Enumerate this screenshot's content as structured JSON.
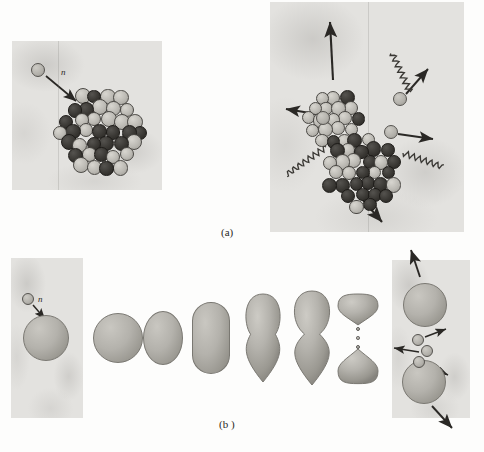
{
  "figure": {
    "background_color": "#fdfdfc",
    "panel_color": "#e3e2df",
    "ink_color": "#2a2825"
  },
  "captions": {
    "a": "(a)",
    "b": "(b )"
  },
  "labels": {
    "neutron_a": "n",
    "neutron_b": "n"
  },
  "panel_a": {
    "name": "nucleon-model-panel",
    "left": {
      "name": "before-fission-box",
      "description": "incident neutron approaching a heavy nucleus of packed nucleons",
      "incident_neutron": {
        "cx": 38,
        "cy": 70,
        "r": 7
      },
      "label_pos": {
        "x": 61,
        "y": 68
      },
      "arrow": {
        "x1": 46,
        "y1": 76,
        "x2": 76,
        "y2": 101
      },
      "nucleus": {
        "cx": 101,
        "cy": 132,
        "r": 47,
        "nucleon_r": 7.5,
        "nucleon_count": 78
      }
    },
    "right": {
      "name": "after-fission-box",
      "description": "two fission fragments recoiling, three free neutrons and gamma rays emitted",
      "fragments": [
        {
          "name": "upper-fragment",
          "cx": 333,
          "cy": 119,
          "r": 29,
          "nucleon_r": 7,
          "nucleon_count": 30
        },
        {
          "name": "lower-fragment",
          "cx": 362,
          "cy": 173,
          "r": 38,
          "nucleon_r": 7.2,
          "nucleon_count": 48
        }
      ],
      "neutrons": [
        {
          "name": "neutron-left",
          "cx": 323,
          "cy": 118,
          "r": 7
        },
        {
          "name": "neutron-upper-right",
          "cx": 400,
          "cy": 99,
          "r": 7
        },
        {
          "name": "neutron-right",
          "cx": 391,
          "cy": 132,
          "r": 7
        }
      ],
      "fragment_arrows": [
        {
          "name": "upper-fragment-arrow",
          "x1": 333,
          "y1": 80,
          "x2": 330,
          "y2": 22
        },
        {
          "name": "lower-fragment-arrow",
          "x1": 362,
          "y1": 199,
          "x2": 382,
          "y2": 222
        }
      ],
      "neutron_arrows": [
        {
          "name": "neutron-left-arrow",
          "x1": 316,
          "y1": 114,
          "x2": 286,
          "y2": 109
        },
        {
          "name": "neutron-upper-right-arrow",
          "x1": 406,
          "y1": 94,
          "x2": 428,
          "y2": 69
        },
        {
          "name": "neutron-right-arrow",
          "x1": 398,
          "y1": 134,
          "x2": 433,
          "y2": 139
        }
      ],
      "gamma_rays": [
        {
          "name": "gamma-ray-upper",
          "x1": 410,
          "y1": 92,
          "x2": 392,
          "y2": 53
        },
        {
          "name": "gamma-ray-lower-left",
          "x1": 326,
          "y1": 147,
          "x2": 286,
          "y2": 175
        },
        {
          "name": "gamma-ray-lower-right",
          "x1": 403,
          "y1": 153,
          "x2": 443,
          "y2": 167
        }
      ]
    }
  },
  "panel_b": {
    "name": "liquid-drop-model-panel",
    "left": {
      "name": "drop-before-fission-box",
      "incident_neutron": {
        "cx": 28,
        "cy": 299,
        "r": 6
      },
      "label_pos": {
        "x": 38,
        "y": 295
      },
      "arrow": {
        "x1": 33,
        "y1": 305,
        "x2": 45,
        "y2": 319
      },
      "drop": {
        "cx": 46,
        "cy": 338,
        "rx": 23,
        "ry": 23
      }
    },
    "sequence": [
      {
        "name": "stage-sphere",
        "shape": "sphere",
        "cx": 118,
        "cy": 338,
        "rx": 25,
        "ry": 25
      },
      {
        "name": "stage-ellipse",
        "shape": "ellipse",
        "cx": 163,
        "cy": 338,
        "rx": 20,
        "ry": 27
      },
      {
        "name": "stage-elongated",
        "shape": "capsule",
        "cx": 211,
        "cy": 338,
        "rx": 19,
        "ry": 36
      },
      {
        "name": "stage-waisted",
        "shape": "dumbbell",
        "cx": 263,
        "cy": 338,
        "rx": 20,
        "ry": 45,
        "neck": 0.62
      },
      {
        "name": "stage-necked",
        "shape": "dumbbell",
        "cx": 312,
        "cy": 338,
        "rx": 22,
        "ry": 48,
        "neck": 0.34
      },
      {
        "name": "stage-scission",
        "shape": "split-pair",
        "cx": 358,
        "cy": 338,
        "rx": 20,
        "ry": 46
      }
    ],
    "right": {
      "name": "drop-fragments-box",
      "fragments": [
        {
          "name": "upper-drop-fragment",
          "cx": 425,
          "cy": 305,
          "r": 22
        },
        {
          "name": "lower-drop-fragment",
          "cx": 424,
          "cy": 382,
          "r": 22
        }
      ],
      "neutrons": [
        {
          "name": "drop-neutron-top",
          "cx": 418,
          "cy": 340,
          "r": 6
        },
        {
          "name": "drop-neutron-middle",
          "cx": 427,
          "cy": 351,
          "r": 6
        },
        {
          "name": "drop-neutron-bottom",
          "cx": 419,
          "cy": 362,
          "r": 6
        }
      ],
      "arrows": [
        {
          "name": "upper-fragment-arrow",
          "x1": 420,
          "y1": 277,
          "x2": 411,
          "y2": 250
        },
        {
          "name": "neutron-top-arrow",
          "x1": 425,
          "y1": 337,
          "x2": 446,
          "y2": 329
        },
        {
          "name": "neutron-middle-arrow",
          "x1": 419,
          "y1": 352,
          "x2": 394,
          "y2": 348
        },
        {
          "name": "neutron-bottom-arrow",
          "x1": 426,
          "y1": 365,
          "x2": 448,
          "y2": 375
        },
        {
          "name": "lower-fragment-arrow",
          "x1": 432,
          "y1": 406,
          "x2": 452,
          "y2": 428
        }
      ]
    }
  }
}
